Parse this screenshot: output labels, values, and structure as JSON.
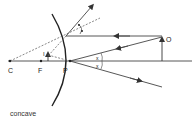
{
  "diagram": {
    "type": "ray-diagram-mirror",
    "caption": "concave",
    "labels": {
      "center": "C",
      "focus": "F",
      "pole": "P",
      "object": "O",
      "image": "I",
      "angle_incident": "x",
      "angle_reflected": "x"
    },
    "colors": {
      "line": "#444444",
      "mirror": "#222222",
      "dashed": "#555555"
    }
  }
}
